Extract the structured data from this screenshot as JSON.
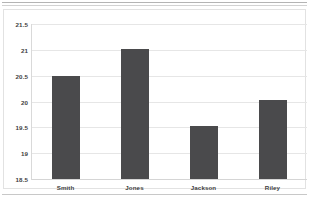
{
  "chart_data": {
    "type": "bar",
    "title": "",
    "subtitle": "",
    "xlabel": "",
    "ylabel": "",
    "categories": [
      "Smith",
      "Jones",
      "Jackson",
      "Riley"
    ],
    "values": [
      20.5,
      21.02,
      19.52,
      20.02
    ],
    "series": [
      {
        "name": "",
        "values": [
          20.5,
          21.02,
          19.52,
          20.02
        ],
        "color": "#4a4a4c"
      }
    ],
    "ylim": [
      18.5,
      21.5
    ],
    "yticks": [
      21.5,
      21,
      20.5,
      20,
      19.5,
      19,
      18.5
    ],
    "ytick_labels": [
      "21.5",
      "21",
      "20.5",
      "20",
      "19.5",
      "19",
      "18.5"
    ],
    "grid": true,
    "grid_axis": "y",
    "legend": false,
    "legend_position": "none",
    "orientation": "vertical",
    "bar_color": "#4a4a4c",
    "plot_background": "#ffffff",
    "gridline_color": "#e6e6e6",
    "axis_color": "#d9d9d9",
    "label_color": "#3e3e3e",
    "annotations": []
  }
}
